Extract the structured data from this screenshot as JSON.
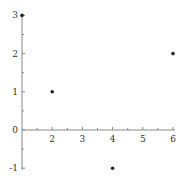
{
  "chart_data": {
    "type": "scatter",
    "title": "",
    "xlabel": "",
    "ylabel": "",
    "xlim": [
      1,
      6
    ],
    "ylim": [
      -1,
      3
    ],
    "grid": false,
    "legend": null,
    "x_ticks": [
      "2",
      "3",
      "4",
      "5",
      "6"
    ],
    "y_ticks": [
      "-1",
      "0",
      "1",
      "2",
      "3"
    ],
    "axis_crossing": {
      "y_axis_at_x": 1,
      "x_axis_at_y": 0
    },
    "points": [
      {
        "x": 1,
        "y": 3
      },
      {
        "x": 2,
        "y": 1
      },
      {
        "x": 4,
        "y": -1
      },
      {
        "x": 6,
        "y": 2
      }
    ],
    "colors": {
      "axis": "#888888",
      "point": "#222222",
      "text": "#333333"
    }
  }
}
